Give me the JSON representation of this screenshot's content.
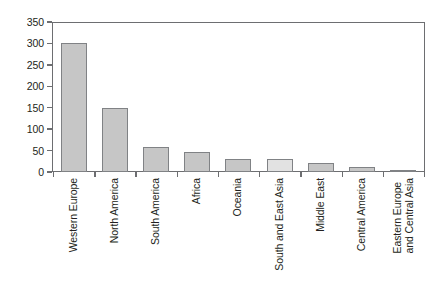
{
  "chart_data": {
    "type": "bar",
    "title": "",
    "xlabel": "",
    "ylabel": "",
    "ylim": [
      0,
      350
    ],
    "yticks": [
      0,
      50,
      100,
      150,
      200,
      250,
      300,
      350
    ],
    "grid": false,
    "legend": "none",
    "categories": [
      "Western Europe",
      "North America",
      "South America",
      "Africa",
      "Oceania",
      "South and East Asia",
      "Middle East",
      "Central America",
      "Eastern Europe and Central Asia"
    ],
    "category_lines": [
      [
        "Western Europe"
      ],
      [
        "North America"
      ],
      [
        "South America"
      ],
      [
        "Africa"
      ],
      [
        "Oceania"
      ],
      [
        "South and East Asia"
      ],
      [
        "Middle East"
      ],
      [
        "Central America"
      ],
      [
        "Eastern Europe",
        "and Central Asia"
      ]
    ],
    "values": [
      302,
      149,
      58,
      47,
      30,
      30,
      22,
      11,
      5
    ],
    "bar_colors": [
      "#c6c6c6",
      "#c6c6c6",
      "#c6c6c6",
      "#c6c6c6",
      "#c6c6c6",
      "#e2e2e2",
      "#c6c6c6",
      "#c6c6c6",
      "#c6c6c6"
    ],
    "highlighted_category": "South and East Asia",
    "colors": {
      "bar_fill": "#c6c6c6",
      "bar_fill_highlight": "#e2e2e2",
      "bar_stroke": "#808285",
      "axis": "#6d6e71",
      "text": "#231f20",
      "background": "#ffffff"
    }
  },
  "axis": {
    "y_tick_labels": [
      "0",
      "50",
      "100",
      "150",
      "200",
      "250",
      "300",
      "350"
    ]
  }
}
